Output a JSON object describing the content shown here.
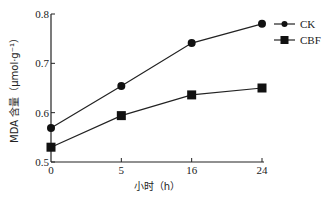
{
  "chart_data": {
    "type": "line",
    "title": "",
    "xlabel": "小时（h）",
    "ylabel": "MDA 含量（μmol·g⁻¹）",
    "categories": [
      "0",
      "5",
      "16",
      "24"
    ],
    "ylim": [
      0.5,
      0.8
    ],
    "yticks": [
      "0.5",
      "0.6",
      "0.7",
      "0.8"
    ],
    "grid": false,
    "legend_position": "top-right",
    "series": [
      {
        "name": "CK",
        "marker": "circle",
        "values": [
          0.569,
          0.654,
          0.741,
          0.78
        ]
      },
      {
        "name": "CBF",
        "marker": "square",
        "values": [
          0.53,
          0.594,
          0.636,
          0.65
        ]
      }
    ],
    "colors": {
      "line": "#222222",
      "marker": "#111111"
    }
  }
}
